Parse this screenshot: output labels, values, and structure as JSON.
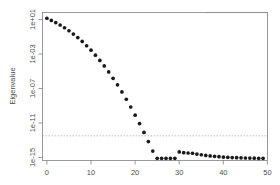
{
  "chart_data": {
    "type": "scatter",
    "title": "",
    "subtitle": "",
    "xlabel": "",
    "ylabel": "Eigenvalue",
    "yscale": "log",
    "xscale": "linear",
    "grid": false,
    "legend": null,
    "xlim": [
      0,
      51
    ],
    "ylim": [
      1e-16,
      100.0
    ],
    "xticks": [
      0,
      10,
      20,
      30,
      40,
      50
    ],
    "xticklabels": [
      "0",
      "10",
      "20",
      "30",
      "40",
      "50"
    ],
    "yticks": [
      10.0,
      0.001,
      1e-07,
      1e-11,
      1e-15
    ],
    "yticklabels": [
      "1e+01",
      "1e-03",
      "1e-07",
      "1e-11",
      "1e-15"
    ],
    "annotations": [
      {
        "kind": "hline",
        "name": "tolerance-reference-line",
        "y": 1e-13,
        "style": "dashed",
        "color": "#9a9a9a"
      }
    ],
    "series": [
      {
        "name": "Eigenvalue spectrum",
        "marker": "filled-circle",
        "color": "#1a1a1a",
        "x": [
          1,
          2,
          3,
          4,
          5,
          6,
          7,
          8,
          9,
          10,
          11,
          12,
          13,
          14,
          15,
          16,
          17,
          18,
          19,
          20,
          21,
          22,
          23,
          24,
          25,
          26,
          27,
          28,
          29,
          30,
          31,
          32,
          33,
          34,
          35,
          36,
          37,
          38,
          39,
          40,
          41,
          42,
          43,
          44,
          45,
          46,
          47,
          48,
          49,
          50
        ],
        "y": [
          20.0,
          11.0,
          6.0,
          3.0,
          1.4,
          0.6,
          0.24,
          0.09,
          0.03,
          0.009,
          0.0026,
          0.00065,
          0.00015,
          3.2e-05,
          6e-06,
          1e-06,
          1.6e-07,
          2.2e-08,
          2.8e-09,
          3.2e-10,
          3.3e-11,
          3.1e-12,
          2.6e-13,
          2e-14,
          1.4e-15,
          8.5e-17,
          4.8e-18,
          2.5e-19,
          1.2e-20,
          5e-22,
          1.1e-15,
          9e-16,
          8.2e-16,
          7.6e-16,
          6e-16,
          5e-16,
          4.2e-16,
          3.6e-16,
          3.2e-16,
          2.9e-16,
          2.6e-16,
          2.4e-16,
          2.3e-16,
          2.2e-16,
          2.1e-16,
          2e-16,
          1.95e-16,
          1.9e-16,
          1.85e-16,
          1.8e-16
        ]
      }
    ]
  },
  "axes": {
    "y_title": "Eigenvalue",
    "x_title": ""
  }
}
